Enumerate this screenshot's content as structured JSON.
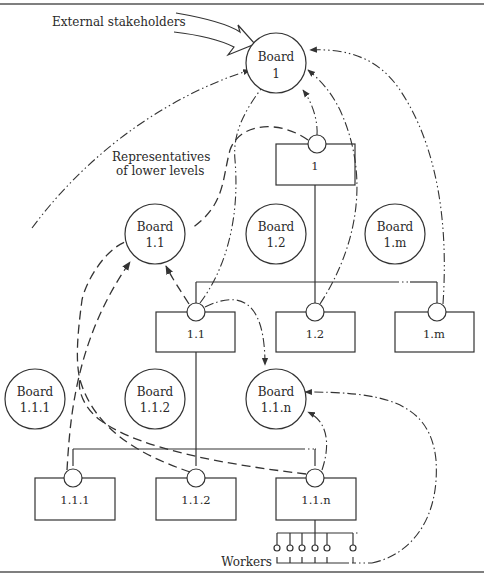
{
  "diagram": {
    "labels": {
      "external_stakeholders": "External stakeholders",
      "representatives_line1": "Representatives",
      "representatives_line2": "of lower levels",
      "workers": "Workers"
    },
    "boards": [
      {
        "id": "b1",
        "line1": "Board",
        "line2": "1"
      },
      {
        "id": "b11",
        "line1": "Board",
        "line2": "1.1"
      },
      {
        "id": "b12",
        "line1": "Board",
        "line2": "1.2"
      },
      {
        "id": "b1m",
        "line1": "Board",
        "line2": "1.m"
      },
      {
        "id": "b111",
        "line1": "Board",
        "line2": "1.1.1"
      },
      {
        "id": "b112",
        "line1": "Board",
        "line2": "1.1.2"
      },
      {
        "id": "b11n",
        "line1": "Board",
        "line2": "1.1.n"
      }
    ],
    "units": [
      {
        "id": "u1",
        "label": "1"
      },
      {
        "id": "u11",
        "label": "1.1"
      },
      {
        "id": "u12",
        "label": "1.2"
      },
      {
        "id": "u1m",
        "label": "1.m"
      },
      {
        "id": "u111",
        "label": "1.1.1"
      },
      {
        "id": "u112",
        "label": "1.1.2"
      },
      {
        "id": "u11n",
        "label": "1.1.n"
      }
    ],
    "workers_count_shown": 6
  }
}
